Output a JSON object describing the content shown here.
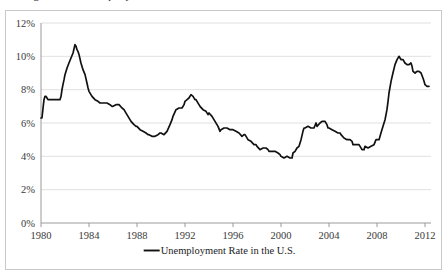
{
  "figure": {
    "caption_remnant": "Figure 1. Unemployment",
    "background_color": "#ffffff",
    "frame_color": "#c9c9c9"
  },
  "chart_data": {
    "type": "line",
    "title": "",
    "xlabel": "",
    "ylabel": "",
    "xlim": [
      1980,
      2012.5
    ],
    "ylim": [
      0,
      12
    ],
    "grid": "horizontal",
    "legend_position": "bottom",
    "line_color": "#111111",
    "gridline_color": "#d8d8d8",
    "axis_color": "#9a9a9a",
    "y_ticks": [
      0,
      2,
      4,
      6,
      8,
      10,
      12
    ],
    "y_tick_labels": [
      "0%",
      "2%",
      "4%",
      "6%",
      "8%",
      "10%",
      "12%"
    ],
    "x_ticks": [
      1980,
      1984,
      1988,
      1992,
      1996,
      2000,
      2004,
      2008,
      2012
    ],
    "x_tick_labels": [
      "1980",
      "1984",
      "1988",
      "1992",
      "1996",
      "2000",
      "2004",
      "2008",
      "2012"
    ],
    "series": [
      {
        "name": "Unemployment Rate in the U.S.",
        "x": [
          1980.0,
          1980.08,
          1980.17,
          1980.25,
          1980.33,
          1980.42,
          1980.5,
          1980.58,
          1980.67,
          1980.75,
          1980.83,
          1980.92,
          1981.0,
          1981.17,
          1981.33,
          1981.5,
          1981.58,
          1981.67,
          1981.75,
          1981.83,
          1981.92,
          1982.0,
          1982.17,
          1982.33,
          1982.5,
          1982.67,
          1982.83,
          1982.92,
          1983.0,
          1983.08,
          1983.17,
          1983.33,
          1983.5,
          1983.67,
          1983.83,
          1983.92,
          1984.0,
          1984.25,
          1984.5,
          1984.75,
          1984.92,
          1985.0,
          1985.25,
          1985.5,
          1985.75,
          1985.92,
          1986.0,
          1986.25,
          1986.5,
          1986.75,
          1986.92,
          1987.0,
          1987.25,
          1987.5,
          1987.75,
          1987.92,
          1988.0,
          1988.25,
          1988.5,
          1988.75,
          1988.92,
          1989.0,
          1989.25,
          1989.5,
          1989.75,
          1989.92,
          1990.0,
          1990.25,
          1990.5,
          1990.75,
          1990.92,
          1991.0,
          1991.25,
          1991.5,
          1991.75,
          1991.92,
          1992.0,
          1992.17,
          1992.33,
          1992.5,
          1992.67,
          1992.83,
          1992.92,
          1993.0,
          1993.25,
          1993.5,
          1993.75,
          1993.92,
          1994.0,
          1994.25,
          1994.5,
          1994.75,
          1994.92,
          1995.0,
          1995.25,
          1995.5,
          1995.75,
          1995.92,
          1996.0,
          1996.25,
          1996.5,
          1996.75,
          1996.92,
          1997.0,
          1997.25,
          1997.5,
          1997.75,
          1997.92,
          1998.0,
          1998.25,
          1998.5,
          1998.75,
          1998.92,
          1999.0,
          1999.25,
          1999.5,
          1999.75,
          1999.92,
          2000.0,
          2000.25,
          2000.5,
          2000.75,
          2000.92,
          2001.0,
          2001.17,
          2001.33,
          2001.5,
          2001.67,
          2001.83,
          2001.92,
          2002.0,
          2002.25,
          2002.5,
          2002.75,
          2002.92,
          2003.0,
          2003.25,
          2003.42,
          2003.5,
          2003.67,
          2003.83,
          2003.92,
          2004.0,
          2004.25,
          2004.5,
          2004.75,
          2004.92,
          2005.0,
          2005.25,
          2005.5,
          2005.75,
          2005.92,
          2006.0,
          2006.25,
          2006.5,
          2006.75,
          2006.92,
          2007.0,
          2007.25,
          2007.5,
          2007.75,
          2007.92,
          2008.0,
          2008.17,
          2008.33,
          2008.5,
          2008.67,
          2008.83,
          2008.92,
          2009.0,
          2009.17,
          2009.33,
          2009.5,
          2009.67,
          2009.83,
          2009.92,
          2010.0,
          2010.17,
          2010.33,
          2010.5,
          2010.67,
          2010.83,
          2010.92,
          2011.0,
          2011.17,
          2011.33,
          2011.5,
          2011.67,
          2011.83,
          2011.92,
          2012.0,
          2012.17,
          2012.33
        ],
        "y": [
          6.3,
          6.3,
          6.9,
          7.4,
          7.6,
          7.6,
          7.5,
          7.4,
          7.4,
          7.4,
          7.4,
          7.4,
          7.4,
          7.4,
          7.4,
          7.4,
          7.4,
          7.6,
          8.0,
          8.3,
          8.6,
          8.9,
          9.3,
          9.6,
          9.9,
          10.2,
          10.7,
          10.6,
          10.4,
          10.3,
          10.1,
          9.6,
          9.2,
          8.9,
          8.4,
          8.1,
          7.9,
          7.6,
          7.4,
          7.3,
          7.2,
          7.2,
          7.2,
          7.2,
          7.1,
          7.0,
          7.0,
          7.1,
          7.1,
          6.9,
          6.8,
          6.7,
          6.4,
          6.1,
          5.9,
          5.8,
          5.8,
          5.6,
          5.5,
          5.4,
          5.3,
          5.3,
          5.2,
          5.2,
          5.3,
          5.4,
          5.4,
          5.3,
          5.5,
          5.9,
          6.2,
          6.4,
          6.8,
          6.9,
          6.9,
          7.1,
          7.3,
          7.4,
          7.5,
          7.7,
          7.6,
          7.4,
          7.4,
          7.3,
          7.0,
          6.8,
          6.7,
          6.5,
          6.6,
          6.4,
          6.1,
          5.8,
          5.5,
          5.6,
          5.7,
          5.7,
          5.6,
          5.6,
          5.6,
          5.5,
          5.4,
          5.2,
          5.3,
          5.3,
          5.0,
          4.9,
          4.7,
          4.7,
          4.6,
          4.4,
          4.5,
          4.5,
          4.4,
          4.3,
          4.3,
          4.3,
          4.2,
          4.1,
          4.0,
          3.9,
          4.0,
          3.9,
          3.9,
          4.2,
          4.3,
          4.5,
          4.6,
          5.0,
          5.5,
          5.7,
          5.7,
          5.8,
          5.7,
          5.7,
          6.0,
          5.8,
          6.0,
          6.1,
          6.1,
          6.1,
          5.9,
          5.7,
          5.7,
          5.6,
          5.5,
          5.4,
          5.4,
          5.3,
          5.1,
          5.0,
          5.0,
          4.9,
          4.7,
          4.7,
          4.7,
          4.4,
          4.4,
          4.6,
          4.5,
          4.6,
          4.7,
          5.0,
          5.0,
          5.0,
          5.4,
          5.8,
          6.2,
          6.8,
          7.3,
          7.8,
          8.5,
          9.0,
          9.5,
          9.8,
          10.0,
          9.9,
          9.8,
          9.8,
          9.6,
          9.5,
          9.5,
          9.6,
          9.4,
          9.1,
          9.0,
          9.1,
          9.1,
          9.0,
          8.7,
          8.5,
          8.3,
          8.2,
          8.2
        ]
      }
    ],
    "legend": [
      {
        "label": "Unemployment Rate in the U.S.",
        "color": "#111111",
        "marker": "line"
      }
    ],
    "annotations": [
      {
        "label": "peak",
        "x": 1982.83,
        "y": 10.7
      },
      {
        "label": "peak",
        "x": 1992.5,
        "y": 7.7
      },
      {
        "label": "trough",
        "x": 2000.25,
        "y": 3.9
      },
      {
        "label": "peak",
        "x": 2009.83,
        "y": 10.0
      },
      {
        "label": "trough",
        "x": 2007.75,
        "y": 4.4
      },
      {
        "label": "end",
        "x": 2012.33,
        "y": 8.2
      }
    ]
  }
}
